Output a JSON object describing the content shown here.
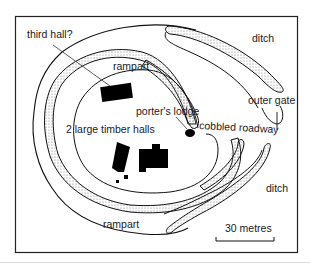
{
  "diagram": {
    "scale_bar": {
      "label": "30 metres"
    },
    "labels": {
      "third_hall": "third hall?",
      "rampart_top": "rampart",
      "rampart_bottom": "rampart",
      "porters_lodge": "porter's lodge",
      "timber_halls": "2 large timber halls",
      "cobbled_roadway": "cobbled roadway",
      "outer_gate": "outer gate",
      "ditch_top": "ditch",
      "ditch_bottom": "ditch"
    },
    "colors": {
      "ink": "#111111",
      "paper": "#ffffff",
      "dots": "#8a8a8a"
    }
  }
}
